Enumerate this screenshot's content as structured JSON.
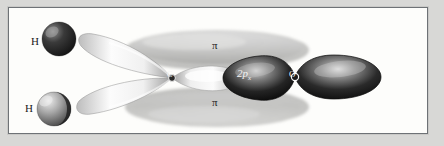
{
  "figure": {
    "type": "molecular-orbital-diagram",
    "molecule": "formaldehyde",
    "frame_color": "#6e7276",
    "background_color": "#fdfdfb",
    "page_background_color": "#d8d8d6"
  },
  "labels": {
    "h_top": "H",
    "h_bottom": "H",
    "pi_top": "π",
    "pi_bottom": "π",
    "carbon": "C",
    "oxygen": "O",
    "p_orbital": "2p",
    "p_orbital_subscript": "x"
  },
  "colors": {
    "orbital_dark": "#1b1b1b",
    "orbital_light": "#fafafa",
    "orbital_mid": "#8b8b8b",
    "pi_cloud": "#c6c6c4",
    "pi_cloud_edge": "#9a9a98",
    "sphere_dark": "#242424",
    "sphere_light": "#cfcfcf"
  },
  "geometry": {
    "carbon_center": [
      163,
      70
    ],
    "oxygen_center": [
      286,
      69
    ],
    "h_top_center": [
      48,
      32
    ],
    "h_bottom_center": [
      42,
      99
    ]
  }
}
